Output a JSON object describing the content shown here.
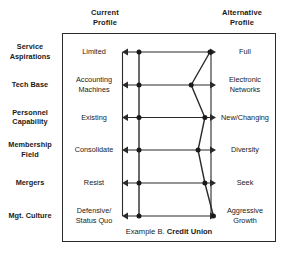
{
  "figure": {
    "caption_prefix": "Example B.",
    "caption_subject": "Credit Union",
    "headers": {
      "left": "Current\nProfile",
      "left_line1": "Current",
      "left_line2": "Profile",
      "right_line1": "Alternative",
      "right_line2": "Profile"
    }
  },
  "chart_data": {
    "type": "line",
    "xlabel": "",
    "ylabel": "",
    "orientation": "horizontal-rows",
    "axis_note": "Each row is a bipolar scale running from the Current Profile pole (left, value 0) to the Alternative Profile pole (right, value 10).",
    "xlim": [
      0,
      10
    ],
    "grid": false,
    "legend_position": "top",
    "series": [
      {
        "name": "Current Profile",
        "values": [
          1,
          1,
          1,
          1,
          1,
          1
        ]
      },
      {
        "name": "Alternative Profile",
        "values": [
          9.3,
          7.1,
          8.7,
          7.9,
          8.7,
          9.7
        ]
      }
    ],
    "categories": [
      "Service Aspirations",
      "Tech Base",
      "Personnel Capability",
      "Membership Field",
      "Mergers",
      "Mgt. Culture"
    ],
    "rows": [
      {
        "label_line1": "Service",
        "label_line2": "Aspirations",
        "current_line1": "Limited",
        "current_line2": "",
        "alternative_line1": "Full",
        "alternative_line2": "",
        "current_value": 1,
        "alternative_value": 9.3
      },
      {
        "label_line1": "Tech Base",
        "label_line2": "",
        "current_line1": "Accounting",
        "current_line2": "Machines",
        "alternative_line1": "Electronic",
        "alternative_line2": "Networks",
        "current_value": 1,
        "alternative_value": 7.1
      },
      {
        "label_line1": "Personnel",
        "label_line2": "Capability",
        "current_line1": "Existing",
        "current_line2": "",
        "alternative_line1": "New/Changing",
        "alternative_line2": "",
        "current_value": 1,
        "alternative_value": 8.7
      },
      {
        "label_line1": "Membership",
        "label_line2": "Field",
        "current_line1": "Consolidate",
        "current_line2": "",
        "alternative_line1": "Diversity",
        "alternative_line2": "",
        "current_value": 1,
        "alternative_value": 7.9
      },
      {
        "label_line1": "Mergers",
        "label_line2": "",
        "current_line1": "Resist",
        "current_line2": "",
        "alternative_line1": "Seek",
        "alternative_line2": "",
        "current_value": 1,
        "alternative_value": 8.7
      },
      {
        "label_line1": "Mgt. Culture",
        "label_line2": "",
        "current_line1": "Defensive/",
        "current_line2": "Status Quo",
        "alternative_line1": "Aggressive",
        "alternative_line2": "Growth",
        "current_value": 1,
        "alternative_value": 9.7
      }
    ],
    "colors": {
      "line": "#2a2a2a",
      "marker": "#1a1a1a",
      "frame": "#2a2a2a",
      "background": "#ffffff"
    }
  }
}
